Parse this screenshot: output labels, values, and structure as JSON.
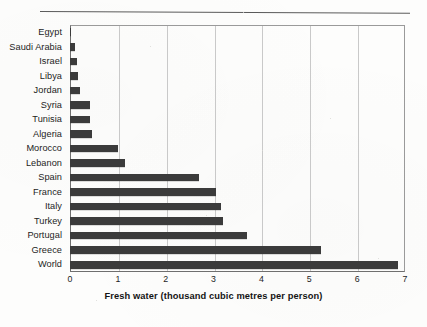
{
  "figure": {
    "axis_title": "Fresh water (thousand cubic metres per person)",
    "bar_color": "#3b3b3b",
    "grid_color": "#c9c9c9",
    "axis_color": "#6f6f6f"
  },
  "chart_data": {
    "type": "bar",
    "orientation": "horizontal",
    "title": "",
    "xlabel": "Fresh water (thousand cubic metres per person)",
    "ylabel": "",
    "xlim": [
      0,
      7
    ],
    "xticks": [
      "0",
      "1",
      "2",
      "3",
      "4",
      "5",
      "6",
      "7"
    ],
    "grid": true,
    "legend": "none",
    "categories": [
      "Egypt",
      "Saudi Arabia",
      "Israel",
      "Libya",
      "Jordan",
      "Syria",
      "Tunisia",
      "Algeria",
      "Morocco",
      "Lebanon",
      "Spain",
      "France",
      "Italy",
      "Turkey",
      "Portugal",
      "Greece",
      "World"
    ],
    "values": [
      0.03,
      0.1,
      0.15,
      0.16,
      0.2,
      0.42,
      0.42,
      0.47,
      1.0,
      1.15,
      2.7,
      3.05,
      3.15,
      3.2,
      3.7,
      5.25,
      6.85
    ]
  }
}
